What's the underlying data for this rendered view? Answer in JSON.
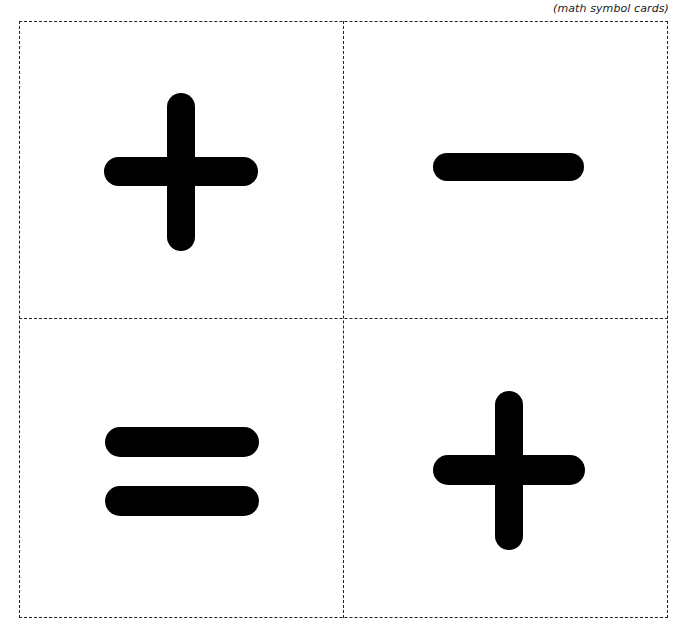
{
  "caption": "(math symbol cards)",
  "colors": {
    "ink": "#000000",
    "cut_line": "#222222",
    "background": "#ffffff"
  },
  "cards": [
    {
      "position": "top-left",
      "symbol": "+",
      "name": "plus"
    },
    {
      "position": "top-right",
      "symbol": "−",
      "name": "minus"
    },
    {
      "position": "bottom-left",
      "symbol": "=",
      "name": "equals"
    },
    {
      "position": "bottom-right",
      "symbol": "+",
      "name": "plus"
    }
  ]
}
